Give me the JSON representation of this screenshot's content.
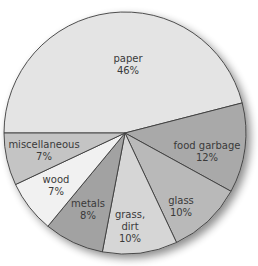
{
  "chart_data": {
    "type": "pie",
    "title": "",
    "categories": [
      "paper",
      "food garbage",
      "glass",
      "grass, dirt",
      "metals",
      "wood",
      "miscellaneous"
    ],
    "values": [
      46,
      12,
      10,
      10,
      8,
      7,
      7
    ],
    "unit": "%",
    "labels": [
      {
        "name": "paper",
        "pct": "46%"
      },
      {
        "name": "food garbage",
        "pct": "12%"
      },
      {
        "name": "glass",
        "pct": "10%"
      },
      {
        "name": "grass,",
        "name2": "dirt",
        "pct": "10%"
      },
      {
        "name": "metals",
        "pct": "8%"
      },
      {
        "name": "wood",
        "pct": "7%"
      },
      {
        "name": "miscellaneous",
        "pct": "7%"
      }
    ],
    "colors": [
      "#e4e4e4",
      "#a9a9a9",
      "#b9b9b9",
      "#d6d6d6",
      "#a2a2a2",
      "#f1f1f1",
      "#c4c4c4"
    ],
    "legend": "none"
  }
}
